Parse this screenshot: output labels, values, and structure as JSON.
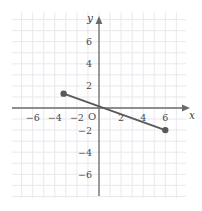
{
  "figure": {
    "name": "coordinate-plane-line-segment",
    "background_color": "#ffffff",
    "grid_color": "#e8e8ee",
    "axis_color": "#6b6b6b",
    "curve_color": "#595959",
    "label_color": "#4a4a4a"
  },
  "axes": {
    "x_name": "x",
    "y_name": "y",
    "origin_label": "O",
    "x_ticks": [
      {
        "value": -6,
        "label": "−6"
      },
      {
        "value": -4,
        "label": "−4"
      },
      {
        "value": -2,
        "label": "−2"
      },
      {
        "value": 2,
        "label": "2"
      },
      {
        "value": 4,
        "label": "4"
      },
      {
        "value": 6,
        "label": "6"
      }
    ],
    "y_ticks": [
      {
        "value": 6,
        "label": "6"
      },
      {
        "value": 4,
        "label": "4"
      },
      {
        "value": 2,
        "label": "2"
      },
      {
        "value": -2,
        "label": "−2"
      },
      {
        "value": -4,
        "label": "−4"
      },
      {
        "value": -6,
        "label": "−6"
      }
    ]
  },
  "chart_data": {
    "type": "line",
    "title": "",
    "xlabel": "x",
    "ylabel": "y",
    "xlim": [
      -7.8,
      7.6
    ],
    "ylim": [
      -7.5,
      7.8
    ],
    "grid": true,
    "grid_step": 1,
    "legend": "none",
    "series": [
      {
        "name": "line-segment",
        "x": [
          -3.2,
          6.0
        ],
        "y": [
          1.3,
          -2.0
        ],
        "endpoints_filled": true,
        "slope": -0.358,
        "y_intercept": 0.15
      }
    ],
    "annotations": [
      {
        "name": "left-endpoint",
        "x": -3.2,
        "y": 1.3,
        "style": "filled-dot"
      },
      {
        "name": "right-endpoint",
        "x": 6.0,
        "y": -2.0,
        "style": "filled-dot"
      }
    ]
  }
}
